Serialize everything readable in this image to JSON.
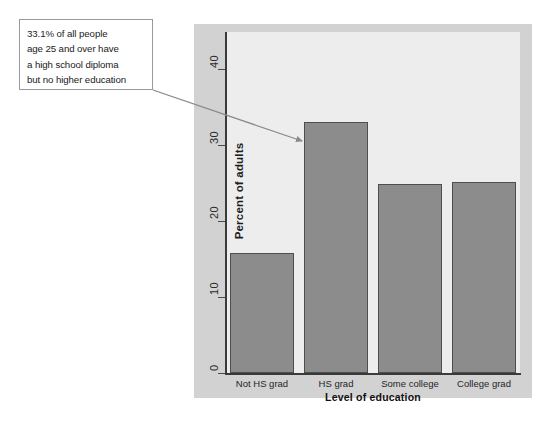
{
  "annotation": {
    "text": "33.1% of all people\nage 25 and over have\na high school diploma\nbut no higher education",
    "arrow_name": "callout-arrow"
  },
  "colors": {
    "panel_background": "#d2d2d2",
    "plot_background": "#ededed",
    "bar_fill": "#8c8c8c",
    "bar_border": "#4e4e4e",
    "axis": "#3a3a3a",
    "callout_border": "#9a9a9a",
    "callout_background": "#ffffff"
  },
  "chart_data": {
    "type": "bar",
    "title": "",
    "categories": [
      "Not HS grad",
      "HS grad",
      "Some college",
      "College grad"
    ],
    "values": [
      15.9,
      33.1,
      25.0,
      25.2
    ],
    "xlabel": "Level of education",
    "ylabel": "Percent of adults",
    "ylim": [
      0,
      45
    ],
    "yticks": [
      0,
      10,
      20,
      30,
      40
    ],
    "ytick_labels": [
      "0",
      "10",
      "20",
      "30",
      "40"
    ],
    "grid": false,
    "legend": "none",
    "annotations": [
      {
        "text": "33.1% of all people age 25 and over have a high school diploma but no higher education",
        "points_to": "HS grad"
      }
    ]
  }
}
